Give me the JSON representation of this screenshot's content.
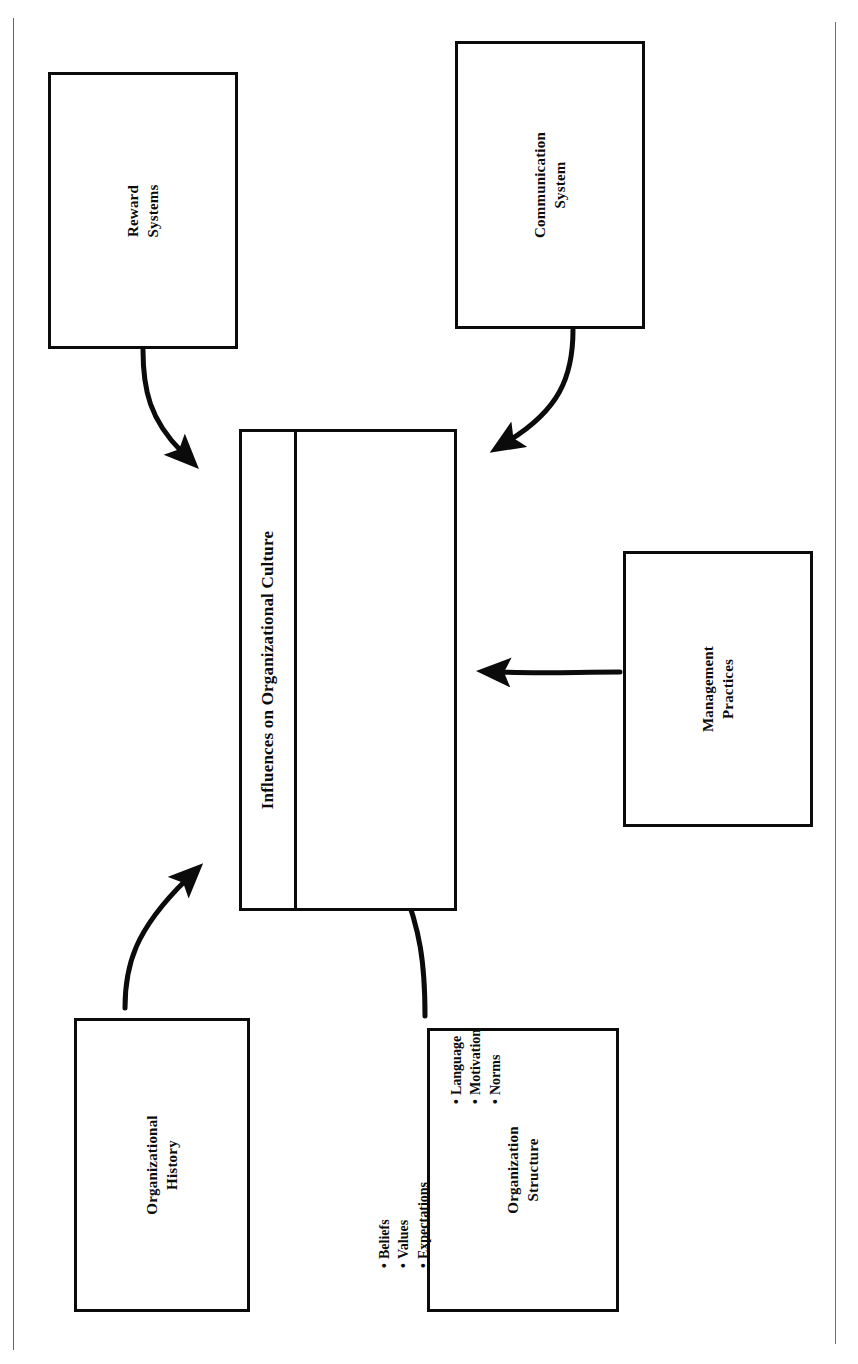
{
  "diagram": {
    "title": "Influences on Organizational Culture",
    "orientation": "rotated-90-ccw scanned page",
    "center": {
      "name": "center-box",
      "title": "Influences on Organizational Culture",
      "bullet_columns": [
        {
          "name": "column-left",
          "items": [
            "Beliefs",
            "Values",
            "Expectations"
          ]
        },
        {
          "name": "column-right",
          "items": [
            "Language",
            "Motivation",
            "Norms"
          ]
        }
      ],
      "bullet_glyph": "•"
    },
    "nodes": [
      {
        "id": "reward-systems",
        "label": "Reward\nSystems",
        "line1": "Reward",
        "line2": "Systems"
      },
      {
        "id": "communication-system",
        "label": "Communication\nSystem",
        "line1": "Communication",
        "line2": "System"
      },
      {
        "id": "management-practices",
        "label": "Management\nPractices",
        "line1": "Management",
        "line2": "Practices"
      },
      {
        "id": "organizational-history",
        "label": "Organizational\nHistory",
        "line1": "Organizational",
        "line2": "History"
      },
      {
        "id": "organization-structure",
        "label": "Organization\nStructure",
        "line1": "Organization",
        "line2": "Structure"
      }
    ],
    "arrows": [
      {
        "id": "arrow-reward-to-center",
        "from": "reward-systems",
        "to": "center-box"
      },
      {
        "id": "arrow-communication-to-center",
        "from": "communication-system",
        "to": "center-box"
      },
      {
        "id": "arrow-management-to-center",
        "from": "management-practices",
        "to": "center-box"
      },
      {
        "id": "arrow-history-to-center",
        "from": "organizational-history",
        "to": "center-box"
      },
      {
        "id": "arrow-structure-to-center",
        "from": "organization-structure",
        "to": "center-box"
      }
    ],
    "colors": {
      "ink": "#0b0b0b",
      "paper": "#ffffff",
      "rule": "#3a3a3a"
    }
  }
}
